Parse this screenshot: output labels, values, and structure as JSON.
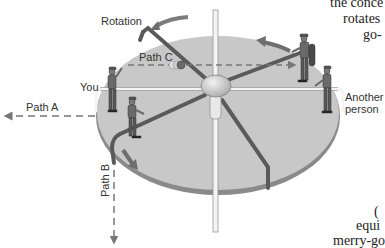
{
  "figure": {
    "labels": {
      "rotation": "Rotation",
      "path_a": "Path A",
      "path_b": "Path B",
      "path_c": "Path C",
      "you": "You",
      "another_person_line1": "Another",
      "another_person_line2": "person"
    },
    "cropped_body_text": {
      "top_right": [
        "the conce",
        "rotates",
        "go-"
      ],
      "bottom_right": [
        "(",
        "equi",
        "merry-go"
      ]
    },
    "colors": {
      "platform_fill": "#c8c8c8",
      "platform_rim": "#8a8a8a",
      "spoke": "#5a5a5a",
      "arrow": "#6e6e6e",
      "dashed_path": "#777777",
      "hub": "#d6d6d6",
      "post": "#f4f4f4"
    },
    "icons": [
      "rotation-arrow-icon",
      "ball-icon",
      "motion-arrow-icon"
    ]
  }
}
